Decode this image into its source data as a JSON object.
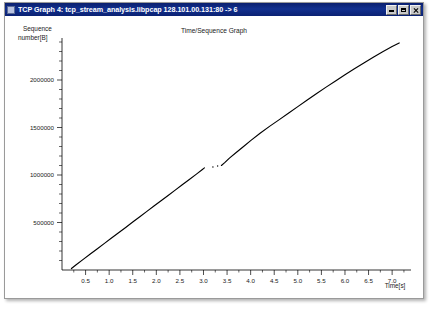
{
  "window": {
    "title": "TCP Graph 4: tcp_stream_analysis.libpcap 128.101.00.131:80 -> 6",
    "icon": "app-icon",
    "buttons": {
      "minimize": "minimize-button",
      "maximize": "maximize-button",
      "close": "close-button"
    }
  },
  "chart_data": {
    "type": "line",
    "title": "Time/Sequence Graph",
    "xlabel": "Time[s]",
    "ylabel": "Sequence number[B]",
    "xlim": [
      0,
      7.4
    ],
    "ylim": [
      0,
      2400000
    ],
    "grid": false,
    "legend": null,
    "x_ticks": [
      0.5,
      1.0,
      1.5,
      2.0,
      2.5,
      3.0,
      3.5,
      4.0,
      4.5,
      5.0,
      5.5,
      6.0,
      6.5,
      7.0
    ],
    "x_tick_labels": [
      "0.5",
      "1.0",
      "1.5",
      "2.0",
      "2.5",
      "3.0",
      "3.5",
      "4.0",
      "4.5",
      "5.0",
      "5.5",
      "6.0",
      "6.5",
      "7.0"
    ],
    "y_ticks": [
      500000,
      1000000,
      1500000,
      2000000
    ],
    "y_tick_labels": [
      "500000",
      "1000000",
      "1500000",
      "2000000"
    ],
    "y_minor_tick_step": 100000,
    "series": [
      {
        "name": "sequence",
        "x": [
          0.2,
          0.3,
          0.45,
          0.6,
          0.75,
          0.9,
          1.05,
          1.2,
          1.35,
          1.5,
          1.65,
          1.8,
          1.95,
          2.1,
          2.25,
          2.4,
          2.55,
          2.7,
          2.85,
          2.97,
          3.02,
          3.2,
          3.3,
          3.38,
          3.45,
          3.55,
          3.7,
          3.85,
          4.0,
          4.2,
          4.4,
          4.6,
          4.8,
          5.0,
          5.2,
          5.4,
          5.6,
          5.8,
          6.0,
          6.2,
          6.4,
          6.6,
          6.8,
          7.0,
          7.15
        ],
        "y": [
          15000,
          55000,
          112000,
          168000,
          224000,
          280000,
          336000,
          392000,
          448000,
          505000,
          561000,
          617000,
          673000,
          729000,
          785000,
          841000,
          897000,
          953000,
          1009000,
          1055000,
          1075000,
          1085000,
          1095000,
          1100000,
          1130000,
          1178000,
          1240000,
          1300000,
          1362000,
          1440000,
          1512000,
          1580000,
          1650000,
          1720000,
          1790000,
          1858000,
          1925000,
          1990000,
          2055000,
          2118000,
          2180000,
          2240000,
          2298000,
          2352000,
          2390000
        ],
        "gap_x_range": [
          3.02,
          3.38
        ],
        "color": "#000000"
      }
    ]
  }
}
